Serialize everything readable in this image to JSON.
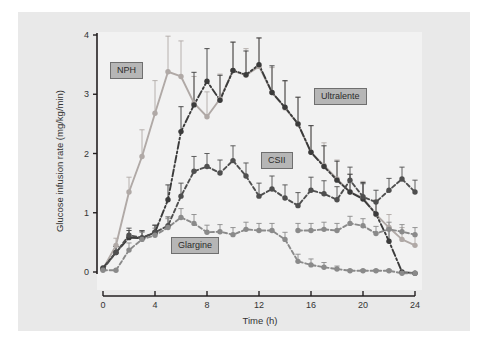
{
  "chart_data": {
    "type": "line",
    "title": "",
    "xlabel": "Time (h)",
    "ylabel": "Glucose infusion rate (mg/kg/min)",
    "xlim": [
      0,
      24
    ],
    "ylim": [
      0,
      4
    ],
    "xticks": [
      0,
      4,
      8,
      12,
      16,
      20,
      24
    ],
    "yticks": [
      0,
      1,
      2,
      3,
      4
    ],
    "grid": false,
    "legend_position": "inline-labels",
    "x": [
      0,
      1,
      2,
      3,
      4,
      5,
      6,
      7,
      8,
      9,
      10,
      11,
      12,
      13,
      14,
      15,
      16,
      17,
      18,
      19,
      20,
      21,
      22,
      23,
      24
    ],
    "series": [
      {
        "name": "NPH",
        "color": "#b0a9a6",
        "linestyle": "solid",
        "values": [
          0.05,
          0.45,
          1.35,
          1.95,
          2.68,
          3.38,
          3.3,
          2.85,
          2.62,
          2.92,
          3.4,
          3.32,
          3.47,
          3.03,
          2.77,
          2.5,
          2.02,
          1.8,
          1.57,
          1.35,
          1.25,
          0.97,
          0.75,
          0.55,
          0.45
        ],
        "errors": [
          0.0,
          0.12,
          0.25,
          0.45,
          0.55,
          0.6,
          0.6,
          0.45,
          0.42,
          0.42,
          0.48,
          0.45,
          0.48,
          0.42,
          0.45,
          0.45,
          0.45,
          0.38,
          0.32,
          0.3,
          0.28,
          0.25,
          0.22,
          0.2,
          0.18
        ]
      },
      {
        "name": "Ultralente",
        "color": "#3b3b3b",
        "linestyle": "dashdot",
        "values": [
          0.07,
          0.33,
          0.58,
          0.57,
          0.67,
          1.22,
          2.37,
          2.82,
          3.22,
          2.9,
          3.4,
          3.33,
          3.5,
          3.03,
          2.78,
          2.5,
          2.02,
          1.78,
          1.55,
          1.35,
          1.23,
          0.98,
          0.52,
          0.0,
          -0.02
        ],
        "errors": [
          0.0,
          0.1,
          0.12,
          0.12,
          0.12,
          0.25,
          0.42,
          0.55,
          0.55,
          0.42,
          0.48,
          0.4,
          0.45,
          0.45,
          0.45,
          0.45,
          0.45,
          0.35,
          0.32,
          0.3,
          0.28,
          0.22,
          0.22,
          0.0,
          0.0
        ]
      },
      {
        "name": "CSII",
        "color": "#4f4f4f",
        "linestyle": "dashed",
        "values": [
          0.05,
          0.33,
          0.62,
          0.58,
          0.67,
          0.78,
          1.28,
          1.7,
          1.78,
          1.67,
          1.88,
          1.62,
          1.28,
          1.4,
          1.25,
          1.12,
          1.38,
          1.32,
          1.22,
          1.55,
          1.27,
          1.18,
          1.38,
          1.57,
          1.35
        ],
        "errors": [
          0.0,
          0.1,
          0.12,
          0.12,
          0.12,
          0.15,
          0.22,
          0.25,
          0.22,
          0.22,
          0.25,
          0.22,
          0.22,
          0.22,
          0.22,
          0.22,
          0.22,
          0.22,
          0.22,
          0.22,
          0.22,
          0.2,
          0.2,
          0.2,
          0.2
        ]
      },
      {
        "name": "Glargine",
        "color": "#8a8a8a",
        "linestyle": "dashed",
        "values": [
          0.03,
          0.03,
          0.37,
          0.55,
          0.62,
          0.75,
          0.92,
          0.82,
          0.67,
          0.68,
          0.63,
          0.72,
          0.7,
          0.7,
          0.55,
          0.18,
          0.12,
          0.08,
          0.05,
          0.02,
          0.02,
          0.02,
          0.02,
          -0.02,
          -0.02
        ],
        "errors": [
          0.0,
          0.0,
          0.12,
          0.12,
          0.12,
          0.15,
          0.15,
          0.15,
          0.12,
          0.12,
          0.12,
          0.12,
          0.12,
          0.12,
          0.12,
          0.12,
          0.1,
          0.08,
          0.05,
          0.02,
          0.02,
          0.02,
          0.02,
          0.0,
          0.0
        ]
      },
      {
        "name": "Glargine-plateau",
        "color": "#8a8a8a",
        "linestyle": "dashed",
        "values": [
          null,
          null,
          null,
          null,
          null,
          null,
          null,
          null,
          null,
          null,
          null,
          null,
          null,
          null,
          null,
          0.7,
          0.7,
          0.72,
          0.7,
          0.82,
          0.78,
          0.65,
          0.72,
          0.68,
          0.63
        ],
        "errors": [
          null,
          null,
          null,
          null,
          null,
          null,
          null,
          null,
          null,
          null,
          null,
          null,
          null,
          null,
          null,
          0.12,
          0.12,
          0.12,
          0.12,
          0.12,
          0.12,
          0.12,
          0.12,
          0.12,
          0.12
        ]
      }
    ],
    "series_labels": [
      {
        "name": "NPH",
        "text": "NPH"
      },
      {
        "name": "Ultralente",
        "text": "Ultralente"
      },
      {
        "name": "CSII",
        "text": "CSII"
      },
      {
        "name": "Glargine",
        "text": "Glargine"
      }
    ]
  },
  "axis": {
    "xlabel": "Time (h)",
    "ylabel": "Glucose infusion rate (mg/kg/min)",
    "xticklabels": [
      "0",
      "4",
      "8",
      "12",
      "16",
      "20",
      "24"
    ],
    "yticklabels": [
      "0",
      "1",
      "2",
      "3",
      "4"
    ]
  },
  "colors": {
    "panel_background": "#e9e9e9",
    "plot_background": "#f2f2f2",
    "axis": "#231f20",
    "label_box_fill": "#b6b6b6",
    "label_box_border": "#6f6f6f",
    "nph": "#b0a9a6",
    "ultralente": "#3b3b3b",
    "csii": "#4f4f4f",
    "glargine": "#8a8a8a"
  }
}
